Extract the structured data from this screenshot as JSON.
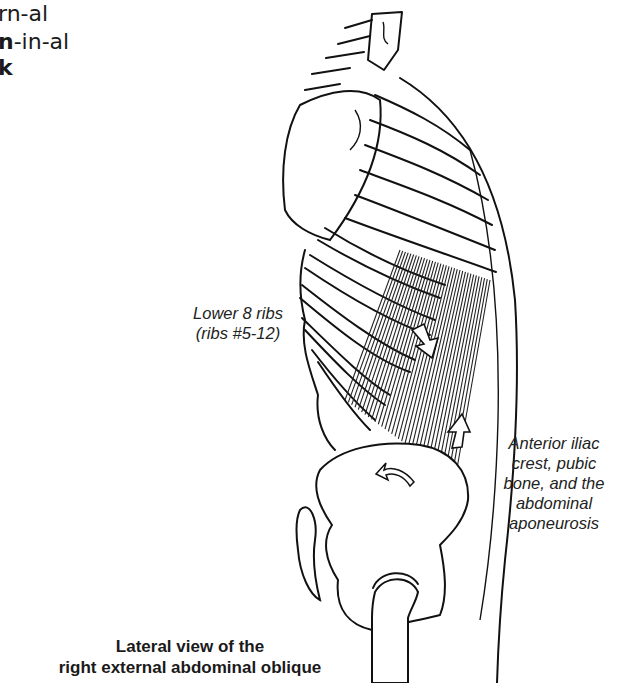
{
  "pronunciation": {
    "line1": {
      "plain": "rn-al",
      "bold": ""
    },
    "line2": {
      "bold": "n",
      "plain": "-in-al"
    },
    "line3": {
      "bold": "k",
      "plain": ""
    }
  },
  "labels": {
    "origin": [
      "Lower 8 ribs",
      "(ribs #5-12)"
    ],
    "insertion": [
      "Anterior iliac",
      "crest, pubic",
      "bone, and the",
      "abdominal",
      "aponeurosis"
    ]
  },
  "caption": [
    "Lateral view of the",
    "right external abdominal oblique"
  ],
  "illustration": {
    "subject": "right external abdominal oblique muscle, lateral view",
    "arrows": [
      "contraction-arrow-down",
      "contraction-arrow-up",
      "rotation-arrow-pelvis"
    ]
  }
}
